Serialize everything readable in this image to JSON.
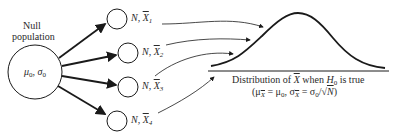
{
  "diagram": {
    "null_population": {
      "title_line1": "Null",
      "title_line2": "population",
      "params": "μ",
      "params_sub0": "0",
      "params_sep": ", σ",
      "params_sub1": "0"
    },
    "samples": [
      {
        "n_label": "N,",
        "xbar": "X",
        "index": "1"
      },
      {
        "n_label": "N,",
        "xbar": "X",
        "index": "2"
      },
      {
        "n_label": "N,",
        "xbar": "X",
        "index": "3"
      },
      {
        "n_label": "N,",
        "xbar": "X",
        "index": "4"
      }
    ],
    "distribution": {
      "caption_prefix": "Distribution of ",
      "caption_var": "X",
      "caption_mid": " when ",
      "caption_h": "H",
      "caption_h_sub": "0",
      "caption_suffix": " is true",
      "formula": "(μ̅X = μ0, σX = σ0/√N)",
      "formula_parts": {
        "open": "(μ",
        "sub_xbar": "X",
        "eq1": " = μ",
        "sub0a": "0",
        "sep": ", σ",
        "sub_xbar2": "X",
        "eq2": " = σ",
        "sub0b": "0",
        "tail": "/√",
        "n": "N",
        "close": ")"
      }
    },
    "colors": {
      "stroke": "#1a1a1a",
      "text": "#2a2a2a"
    }
  }
}
